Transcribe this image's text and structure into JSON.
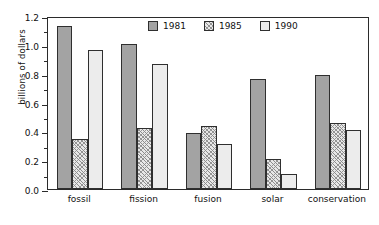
{
  "chart_data": {
    "type": "bar",
    "title": "",
    "subtitle": "",
    "xlabel": "",
    "ylabel": "billions of dollars",
    "categories": [
      "fossil",
      "fission",
      "fusion",
      "solar",
      "conservation"
    ],
    "series": [
      {
        "name": "1981",
        "values": [
          1.13,
          1.005,
          0.39,
          0.765,
          0.79
        ],
        "color": "#a3a3a3",
        "fill": "solid-gray"
      },
      {
        "name": "1985",
        "values": [
          0.345,
          0.42,
          0.435,
          0.21,
          0.455
        ],
        "color": "#e8e8e8",
        "fill": "diagonal-hatch"
      },
      {
        "name": "1990",
        "values": [
          0.965,
          0.865,
          0.31,
          0.105,
          0.41
        ],
        "color": "#ececec",
        "fill": "light-solid"
      }
    ],
    "ylim": [
      0.0,
      1.2
    ],
    "ytick_values": [
      0.0,
      0.2,
      0.4,
      0.6,
      0.8,
      1.0,
      1.2
    ],
    "ytick_labels": [
      "0.0",
      "0.2",
      "0.4",
      "0.6",
      "0.8",
      "1.0",
      "1.2"
    ],
    "yminor_tick_values": [
      0.1,
      0.3,
      0.5,
      0.7,
      0.9,
      1.1
    ],
    "grid": false,
    "legend_position": "top-center-inside",
    "legend_entries": [
      "1981",
      "1985",
      "1990"
    ],
    "annotations": []
  },
  "legend": {
    "items": [
      {
        "label": "1981",
        "swatch": "solid-gray-swatch"
      },
      {
        "label": "1985",
        "swatch": "hatched-swatch"
      },
      {
        "label": "1990",
        "swatch": "light-swatch"
      }
    ]
  },
  "axes": {
    "y_title": "billions of dollars"
  }
}
